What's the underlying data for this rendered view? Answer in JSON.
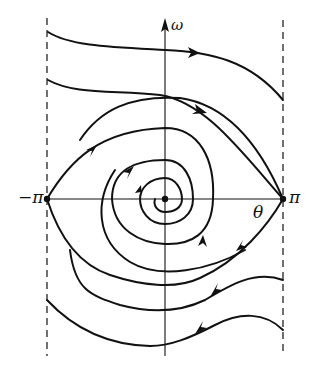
{
  "diagram": {
    "type": "phase-portrait",
    "axes": {
      "x_label": "θ",
      "y_label": "ω",
      "left_boundary_label": "−π",
      "right_boundary_label": "π"
    },
    "colors": {
      "stroke": "#111111",
      "background": "#ffffff"
    },
    "fixed_points": [
      {
        "name": "stable-focus",
        "theta": "0",
        "omega": "0"
      },
      {
        "name": "saddle-left",
        "theta": "−π",
        "omega": "0"
      },
      {
        "name": "saddle-right",
        "theta": "π",
        "omega": "0"
      }
    ],
    "trajectories": [
      {
        "name": "top-running-1",
        "direction": "right"
      },
      {
        "name": "top-running-2",
        "direction": "right"
      },
      {
        "name": "separatrix-spiral",
        "direction": "clockwise-inward"
      },
      {
        "name": "bottom-running-1",
        "direction": "left"
      },
      {
        "name": "bottom-running-2",
        "direction": "left"
      }
    ]
  }
}
